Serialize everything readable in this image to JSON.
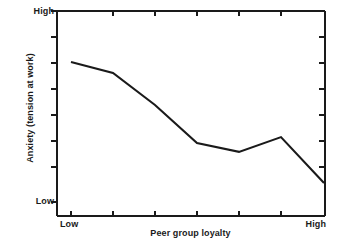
{
  "chart_data": {
    "type": "line",
    "title": "",
    "xlabel": "Peer group loyalty",
    "ylabel": "Anxiety (tension at work)",
    "x_tick_labels": [
      "Low",
      "",
      "",
      "",
      "",
      "",
      "High"
    ],
    "y_tick_labels": [
      "Low",
      "High"
    ],
    "xlim": [
      0,
      6
    ],
    "ylim": [
      0,
      100
    ],
    "grid": false,
    "legend": null,
    "axis_style": "left-and-bottom-spines-with-mirrored-ticks",
    "x": [
      0,
      1,
      2,
      3,
      4,
      5,
      6
    ],
    "values": [
      75.5,
      70.1,
      54.4,
      35.8,
      31.4,
      38.7,
      16.2
    ],
    "series": [
      {
        "name": "Anxiety (tension at work)",
        "color": "#1a1a1a",
        "values": [
          75.5,
          70.1,
          54.4,
          35.8,
          31.4,
          38.7,
          16.2
        ]
      }
    ],
    "annotations": []
  },
  "axes": {
    "y_high_label": "High",
    "y_low_label": "Low",
    "x_low_label": "Low",
    "x_high_label": "High",
    "y_title": "Anxiety (tension at work)",
    "x_title": "Peer group loyalty",
    "line_color": "#1a1a1a",
    "axis_color": "#1a1a1a"
  }
}
